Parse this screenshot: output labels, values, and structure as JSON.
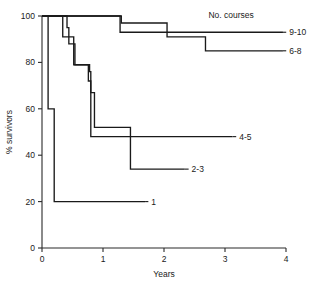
{
  "chart_data": {
    "type": "line",
    "subtype": "kaplan-meier-step",
    "title": "",
    "xlabel": "Years",
    "ylabel": "% survivors",
    "xlim": [
      0,
      4
    ],
    "ylim": [
      0,
      100
    ],
    "xticks": [
      0,
      1,
      2,
      3,
      4
    ],
    "xtick_labels": [
      "0",
      "1",
      "2",
      "3",
      "4"
    ],
    "yticks": [
      0,
      20,
      40,
      60,
      80,
      100
    ],
    "ytick_labels": [
      "0",
      "20",
      "40",
      "60",
      "80",
      "100"
    ],
    "grid": false,
    "legend_title": "No. courses",
    "legend_position": "inline-right-of-curve-ends",
    "series": [
      {
        "name": "9-10",
        "label": "9-10",
        "points": [
          [
            0.0,
            100
          ],
          [
            1.28,
            100
          ],
          [
            1.28,
            93
          ],
          [
            3.95,
            93
          ]
        ],
        "label_x": 4.02,
        "label_y": 93
      },
      {
        "name": "6-8",
        "label": "6-8",
        "points": [
          [
            0.0,
            100
          ],
          [
            1.3,
            100
          ],
          [
            1.3,
            97
          ],
          [
            2.05,
            97
          ],
          [
            2.05,
            91
          ],
          [
            2.68,
            91
          ],
          [
            2.68,
            85
          ],
          [
            3.95,
            85
          ]
        ],
        "label_x": 4.02,
        "label_y": 85
      },
      {
        "name": "4-5",
        "label": "4-5",
        "points": [
          [
            0.0,
            100
          ],
          [
            0.34,
            100
          ],
          [
            0.34,
            91
          ],
          [
            0.52,
            91
          ],
          [
            0.52,
            79
          ],
          [
            0.78,
            79
          ],
          [
            0.78,
            76
          ],
          [
            0.8,
            76
          ],
          [
            0.8,
            48
          ],
          [
            3.12,
            48
          ]
        ],
        "label_x": 3.2,
        "label_y": 48
      },
      {
        "name": "2-3",
        "label": "2-3",
        "points": [
          [
            0.0,
            100
          ],
          [
            0.41,
            100
          ],
          [
            0.41,
            95
          ],
          [
            0.44,
            95
          ],
          [
            0.44,
            88
          ],
          [
            0.54,
            88
          ],
          [
            0.54,
            79
          ],
          [
            0.76,
            79
          ],
          [
            0.76,
            72
          ],
          [
            0.8,
            72
          ],
          [
            0.8,
            67
          ],
          [
            0.86,
            67
          ],
          [
            0.86,
            52
          ],
          [
            1.45,
            52
          ],
          [
            1.45,
            34
          ],
          [
            2.34,
            34
          ]
        ],
        "label_x": 2.42,
        "label_y": 34
      },
      {
        "name": "1",
        "label": "1",
        "points": [
          [
            0.0,
            100
          ],
          [
            0.1,
            100
          ],
          [
            0.1,
            60
          ],
          [
            0.2,
            60
          ],
          [
            0.2,
            20
          ],
          [
            1.69,
            20
          ]
        ],
        "label_x": 1.76,
        "label_y": 20
      }
    ],
    "annotations": [
      {
        "text": "No. courses",
        "x": 3.1,
        "y": 99
      }
    ]
  },
  "axes": {
    "x_axis_name": "years-axis",
    "y_axis_name": "percent-survivors-axis"
  }
}
